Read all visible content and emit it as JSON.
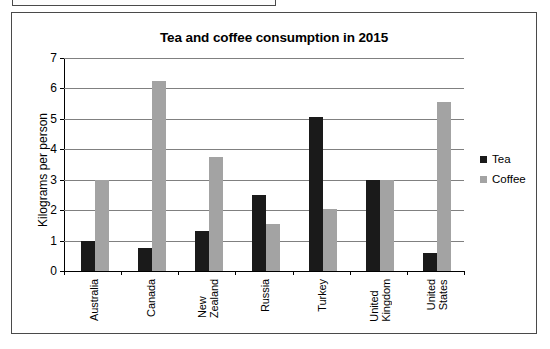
{
  "chart_data": {
    "type": "bar",
    "title": "Tea and coffee consumption in 2015",
    "xlabel": "",
    "ylabel": "Kilograms per person",
    "ylim": [
      0,
      7
    ],
    "ytick_labels": [
      "0",
      "1",
      "2",
      "3",
      "4",
      "5",
      "6",
      "7"
    ],
    "ytick_values": [
      0,
      1,
      2,
      3,
      4,
      5,
      6,
      7
    ],
    "grid": true,
    "legend_position": "right",
    "categories": [
      "Australia",
      "Canada",
      "New\nZealand",
      "Russia",
      "Turkey",
      "United\nKingdom",
      "United\nStates"
    ],
    "series": [
      {
        "name": "Tea",
        "color": "#1a1a1a",
        "values": [
          1.0,
          0.75,
          1.3,
          2.5,
          5.05,
          3.0,
          0.6
        ]
      },
      {
        "name": "Coffee",
        "color": "#a3a3a3",
        "values": [
          3.0,
          6.25,
          3.75,
          1.55,
          2.05,
          3.0,
          5.55
        ]
      }
    ]
  }
}
